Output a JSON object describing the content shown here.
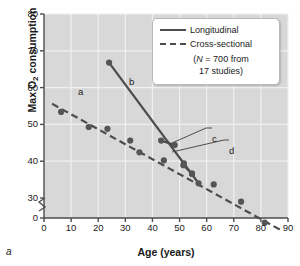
{
  "figure": {
    "panel_letter": "a",
    "xlabel": "Age (years)",
    "ylabel_main": "Max O",
    "ylabel_sub": "2",
    "ylabel_tail": " consumption"
  },
  "legend": {
    "items": [
      {
        "label": "Longitudinal",
        "style": "solid"
      },
      {
        "label": "Cross-sectional",
        "style": "dashed"
      }
    ],
    "note_line1_prefix": "(",
    "note_line1_italic": "N",
    "note_line1_rest": " = 700 from",
    "note_line2": "17 studies)"
  },
  "annotations": [
    {
      "text": "a",
      "x": 78,
      "y": 86
    },
    {
      "text": "b",
      "x": 129,
      "y": 76
    },
    {
      "text": "c",
      "x": 212,
      "y": 133
    },
    {
      "text": "d",
      "x": 229,
      "y": 145
    }
  ],
  "colors": {
    "plot_background": "#d8d8d8",
    "gridline": "#f0f0f0",
    "axis": "#4d4d4d",
    "marker": "#555555",
    "line": "#4d4d4d",
    "text": "#1a1a1a",
    "legend_background": "#ffffff",
    "legend_border": "#b8b8b8"
  },
  "chart_data": {
    "type": "scatter",
    "title": "",
    "xlabel": "Age (years)",
    "ylabel": "Max O2 consumption",
    "xlim": [
      0,
      90
    ],
    "ylim": [
      0,
      80
    ],
    "y_axis_break": {
      "between": [
        0,
        30
      ],
      "note": "axis broken between 0 and 30"
    },
    "xticks": [
      0,
      10,
      20,
      30,
      40,
      50,
      60,
      70,
      80,
      90
    ],
    "yticks": [
      0,
      30,
      40,
      50,
      60,
      70,
      80
    ],
    "grid": true,
    "legend_position": "top-right",
    "series": [
      {
        "name": "Cross-sectional",
        "style": "dashed",
        "trendline": {
          "x": [
            3,
            88
          ],
          "y": [
            55.6,
            21.0
          ]
        },
        "points": [
          {
            "x": 6.3,
            "y": 53.4
          },
          {
            "x": 16.5,
            "y": 49.3
          },
          {
            "x": 23.4,
            "y": 48.8
          },
          {
            "x": 31.8,
            "y": 45.6
          },
          {
            "x": 35.2,
            "y": 42.4
          },
          {
            "x": 44.2,
            "y": 40.2
          },
          {
            "x": 51.6,
            "y": 39.4
          },
          {
            "x": 54.6,
            "y": 36.6
          },
          {
            "x": 62.6,
            "y": 33.7
          },
          {
            "x": 72.7,
            "y": 29.0
          },
          {
            "x": 81.4,
            "y": 23.3
          }
        ]
      },
      {
        "name": "Longitudinal",
        "style": "solid",
        "segments": [
          {
            "label": "b",
            "x": [
              24.0,
              57.0
            ],
            "y": [
              66.8,
              34.0
            ]
          },
          {
            "label": "c",
            "x": [
              43.2,
              48.2
            ],
            "y": [
              45.6,
              44.4
            ]
          },
          {
            "label": "d",
            "x": [
              51.4,
              54.6
            ],
            "y": [
              38.9,
              36.6
            ]
          }
        ],
        "points": [
          {
            "x": 24.0,
            "y": 66.8
          },
          {
            "x": 43.2,
            "y": 45.6
          },
          {
            "x": 48.2,
            "y": 44.4
          },
          {
            "x": 51.4,
            "y": 38.9
          },
          {
            "x": 54.6,
            "y": 36.6
          },
          {
            "x": 57.0,
            "y": 34.0
          }
        ]
      }
    ],
    "annotations": [
      {
        "text": "a",
        "meaning": "cross-sectional regression line"
      },
      {
        "text": "b",
        "meaning": "longitudinal slope"
      },
      {
        "text": "c",
        "meaning": "longitudinal sample segment"
      },
      {
        "text": "d",
        "meaning": "longitudinal sample segment"
      }
    ]
  }
}
